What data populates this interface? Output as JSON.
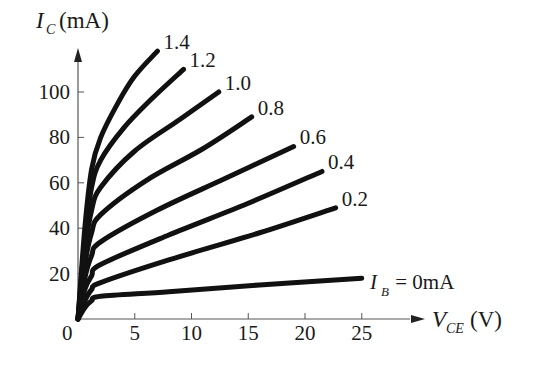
{
  "chart_data": {
    "type": "line",
    "title": "",
    "xlabel": "V_CE (V)",
    "ylabel": "I_C (mA)",
    "xlim": [
      0,
      28
    ],
    "ylim": [
      0,
      125
    ],
    "x_ticks": [
      0,
      5,
      10,
      15,
      20,
      25
    ],
    "y_ticks": [
      20,
      40,
      60,
      80,
      100
    ],
    "grid": false,
    "legend": "curve labels at line ends",
    "series": [
      {
        "name": "1.4",
        "label": "1.4",
        "points": [
          [
            0,
            0
          ],
          [
            0.6,
            40
          ],
          [
            1.2,
            66
          ],
          [
            2,
            80
          ],
          [
            3.5,
            95
          ],
          [
            5,
            107
          ],
          [
            7,
            118
          ]
        ]
      },
      {
        "name": "1.2",
        "label": "1.2",
        "points": [
          [
            0,
            0
          ],
          [
            0.6,
            35
          ],
          [
            1.2,
            58
          ],
          [
            2,
            70
          ],
          [
            4,
            84
          ],
          [
            6.5,
            97
          ],
          [
            9.3,
            110
          ]
        ]
      },
      {
        "name": "1.0",
        "label": "1.0",
        "points": [
          [
            0,
            0
          ],
          [
            0.6,
            30
          ],
          [
            1.2,
            48
          ],
          [
            2,
            58
          ],
          [
            5,
            74
          ],
          [
            9,
            88
          ],
          [
            12.4,
            100
          ]
        ]
      },
      {
        "name": "0.8",
        "label": "0.8",
        "points": [
          [
            0,
            0
          ],
          [
            0.6,
            24
          ],
          [
            1.2,
            38
          ],
          [
            2,
            46
          ],
          [
            6,
            61
          ],
          [
            11,
            75
          ],
          [
            15.3,
            89
          ]
        ]
      },
      {
        "name": "0.6",
        "label": "0.6",
        "points": [
          [
            0,
            0
          ],
          [
            0.6,
            18
          ],
          [
            1.2,
            28
          ],
          [
            2,
            34
          ],
          [
            7,
            48
          ],
          [
            13,
            62
          ],
          [
            19,
            76
          ]
        ]
      },
      {
        "name": "0.4",
        "label": "0.4",
        "points": [
          [
            0,
            0
          ],
          [
            0.6,
            13
          ],
          [
            1.2,
            19
          ],
          [
            2,
            24
          ],
          [
            8,
            37
          ],
          [
            15,
            51
          ],
          [
            21.5,
            65
          ]
        ]
      },
      {
        "name": "0.2",
        "label": "0.2",
        "points": [
          [
            0,
            0
          ],
          [
            0.6,
            8
          ],
          [
            1.2,
            13
          ],
          [
            2,
            16
          ],
          [
            8,
            26
          ],
          [
            16,
            38
          ],
          [
            22.7,
            49
          ]
        ]
      },
      {
        "name": "0",
        "label": "I_B = 0mA",
        "points": [
          [
            0,
            0
          ],
          [
            0.6,
            5
          ],
          [
            1.2,
            8
          ],
          [
            2,
            10
          ],
          [
            8,
            12
          ],
          [
            16,
            15
          ],
          [
            25,
            18
          ]
        ]
      }
    ],
    "axis_labels": {
      "y_main": "I",
      "y_sub": "C",
      "y_unit": "(mA)",
      "x_main": "V",
      "x_sub": "CE",
      "x_unit": "(V)",
      "ib_main": "I",
      "ib_sub": "B",
      "ib_rest": " = 0mA"
    },
    "tick_labels": {
      "x": [
        "5",
        "10",
        "15",
        "20",
        "25"
      ],
      "y": [
        "20",
        "40",
        "60",
        "80",
        "100"
      ],
      "origin": "0"
    },
    "curve_labels": [
      "1.4",
      "1.2",
      "1.0",
      "0.8",
      "0.6",
      "0.4",
      "0.2"
    ],
    "colors": {
      "curve": "#111111",
      "axis": "#555555",
      "text": "#1a1a1a"
    }
  }
}
